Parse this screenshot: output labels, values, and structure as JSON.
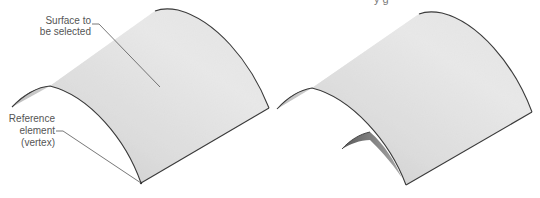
{
  "figure": {
    "type": "technical-illustration",
    "panels": [
      {
        "id": "left",
        "description": "Curved half-cylindrical surface with annotations",
        "labels": {
          "surface_line1": "Surface to",
          "surface_line2": "be selected",
          "reference_line1": "Reference",
          "reference_line2": "element",
          "reference_line3": "(vertex)"
        }
      },
      {
        "id": "right",
        "description": "Same curved surface with a smaller offset curved surface beneath"
      }
    ],
    "cutoff_text": "y            g"
  },
  "colors": {
    "background": "#ffffff",
    "surface_light": "#f4f4f4",
    "surface_mid": "#d9d9d9",
    "surface_dark": "#8c8c8c",
    "edge": "#3a3a3a",
    "label": "#555555"
  }
}
